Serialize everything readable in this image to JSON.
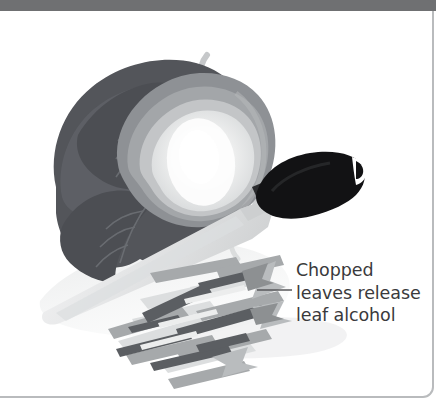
{
  "figure": {
    "type": "illustration",
    "frame": {
      "top_band_color": "#6f7072",
      "border_color": "#b9bbbd",
      "background_color": "#ffffff"
    },
    "annotation": {
      "leader_line": "horizontal-leader-line",
      "line1": "Chopped",
      "line2": "leaves release",
      "line3": "leaf alcohol",
      "text_color": "#3a3a3c"
    },
    "elements": {
      "cabbage_label": "cabbage-head",
      "knife_label": "chef-knife",
      "knife_handle_color": "#111111",
      "knife_blade_color": "#e3e4e5",
      "steam_label": "steam-wisps",
      "shredded_pile_label": "shredded-leaves-pile",
      "shadow_label": "drop-shadow"
    },
    "palette": {
      "leaf_dark": "#53555a",
      "leaf_mid": "#7e8185",
      "leaf_light": "#a9acaf",
      "core_light": "#d8dadb",
      "core_bright": "#f2f3f3",
      "core_white": "#ffffff",
      "strip_dark": "#5b5e62",
      "strip_mid": "#9a9d9f",
      "strip_light": "#cdcfd0"
    }
  }
}
